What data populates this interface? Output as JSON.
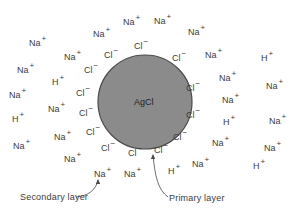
{
  "diagram": {
    "type": "colloid-particle-adsorption",
    "particle": {
      "label": "AgCl",
      "cx": 145,
      "cy": 102,
      "r": 47,
      "fill": "#8b8b8b",
      "stroke": "#4a4a4a"
    },
    "primary_layer_ions": [
      {
        "base": "Cl",
        "charge": "−",
        "x": 134,
        "y": 42
      },
      {
        "base": "Cl",
        "charge": "−",
        "x": 104,
        "y": 51
      },
      {
        "base": "Cl",
        "charge": "−",
        "x": 172,
        "y": 54
      },
      {
        "base": "Cl",
        "charge": "−",
        "x": 84,
        "y": 66
      },
      {
        "base": "Cl",
        "charge": "−",
        "x": 186,
        "y": 84
      },
      {
        "base": "Cl",
        "charge": "−",
        "x": 76,
        "y": 89
      },
      {
        "base": "Cl",
        "charge": "−",
        "x": 79,
        "y": 109
      },
      {
        "base": "Cl",
        "charge": "−",
        "x": 186,
        "y": 111
      },
      {
        "base": "Cl",
        "charge": "−",
        "x": 86,
        "y": 128
      },
      {
        "base": "Cl",
        "charge": "−",
        "x": 173,
        "y": 133
      },
      {
        "base": "Cl",
        "charge": "−",
        "x": 101,
        "y": 144
      },
      {
        "base": "Cl",
        "charge": "−",
        "x": 128,
        "y": 149
      },
      {
        "base": "Cl",
        "charge": "−",
        "x": 154,
        "y": 146
      }
    ],
    "secondary_layer_ions": [
      {
        "base": "Na",
        "charge": "+",
        "x": 123,
        "y": 18
      },
      {
        "base": "Na",
        "charge": "+",
        "x": 154,
        "y": 17
      },
      {
        "base": "Na",
        "charge": "+",
        "x": 93,
        "y": 30
      },
      {
        "base": "Na",
        "charge": "+",
        "x": 188,
        "y": 28
      },
      {
        "base": "Na",
        "charge": "+",
        "x": 29,
        "y": 39
      },
      {
        "base": "Na",
        "charge": "+",
        "x": 64,
        "y": 53
      },
      {
        "base": "Na",
        "charge": "+",
        "x": 205,
        "y": 51
      },
      {
        "base": "H",
        "charge": "+",
        "x": 261,
        "y": 54
      },
      {
        "base": "Na",
        "charge": "+",
        "x": 17,
        "y": 66
      },
      {
        "base": "Na",
        "charge": "+",
        "x": 219,
        "y": 74
      },
      {
        "base": "H",
        "charge": "+",
        "x": 52,
        "y": 78
      },
      {
        "base": "Na",
        "charge": "+",
        "x": 266,
        "y": 82
      },
      {
        "base": "Na",
        "charge": "+",
        "x": 9,
        "y": 91
      },
      {
        "base": "Na",
        "charge": "+",
        "x": 222,
        "y": 96
      },
      {
        "base": "Na",
        "charge": "+",
        "x": 48,
        "y": 105
      },
      {
        "base": "H",
        "charge": "+",
        "x": 12,
        "y": 115
      },
      {
        "base": "H",
        "charge": "+",
        "x": 223,
        "y": 118
      },
      {
        "base": "Na",
        "charge": "+",
        "x": 269,
        "y": 117
      },
      {
        "base": "Na",
        "charge": "+",
        "x": 54,
        "y": 133
      },
      {
        "base": "Na",
        "charge": "+",
        "x": 212,
        "y": 139
      },
      {
        "base": "Na",
        "charge": "+",
        "x": 13,
        "y": 142
      },
      {
        "base": "Na",
        "charge": "+",
        "x": 264,
        "y": 144
      },
      {
        "base": "Na",
        "charge": "+",
        "x": 64,
        "y": 155
      },
      {
        "base": "Na",
        "charge": "+",
        "x": 192,
        "y": 160
      },
      {
        "base": "H",
        "charge": "+",
        "x": 253,
        "y": 162
      },
      {
        "base": "H",
        "charge": "+",
        "x": 168,
        "y": 167
      },
      {
        "base": "Na",
        "charge": "+",
        "x": 94,
        "y": 170
      },
      {
        "base": "Na",
        "charge": "+",
        "x": 124,
        "y": 170
      }
    ],
    "captions": {
      "secondary": {
        "text": "Secondary layer",
        "x": 20,
        "y": 192
      },
      "primary": {
        "text": "Primary layer",
        "x": 169,
        "y": 193
      }
    },
    "arrows": {
      "secondary": {
        "path": "M 76 197 C 88 196, 96 190, 98 180",
        "head_x": 98,
        "head_y": 180
      },
      "primary": {
        "path": "M 168 197 C 158 190, 155 176, 153 155",
        "head_x": 153,
        "head_y": 155
      }
    },
    "ink_color": "#3c3c3c"
  }
}
